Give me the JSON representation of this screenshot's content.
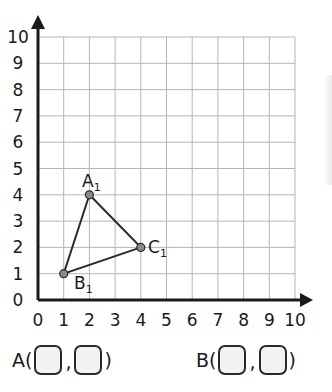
{
  "chart_data": {
    "type": "scatter",
    "title": "",
    "xlabel": "",
    "ylabel": "",
    "xlim": [
      0,
      10
    ],
    "ylim": [
      0,
      10
    ],
    "grid": true,
    "x_ticks": [
      "0",
      "1",
      "2",
      "3",
      "4",
      "5",
      "6",
      "7",
      "8",
      "9",
      "10"
    ],
    "y_ticks": [
      "0",
      "1",
      "2",
      "3",
      "4",
      "5",
      "6",
      "7",
      "8",
      "9",
      "10"
    ],
    "shape": "triangle",
    "points": [
      {
        "label": "A₁",
        "x": 2,
        "y": 4
      },
      {
        "label": "B₁",
        "x": 1,
        "y": 1
      },
      {
        "label": "C₁",
        "x": 4,
        "y": 2
      }
    ],
    "polygon_order": [
      "A₁",
      "C₁",
      "B₁"
    ]
  },
  "labels": {
    "A1_main": "A",
    "A1_sub": "1",
    "B1_main": "B",
    "B1_sub": "1",
    "C1_main": "C",
    "C1_sub": "1"
  },
  "answers": {
    "a": {
      "prefix": "A(",
      "separator": ",",
      "suffix": ")",
      "x_value": "",
      "y_value": ""
    },
    "b": {
      "prefix": "B(",
      "separator": ",",
      "suffix": ")",
      "x_value": "",
      "y_value": ""
    }
  },
  "colors": {
    "axis": "#1a1a1a",
    "grid": "#b5b5b5",
    "triangle": "#2a2a2a",
    "point_fill": "#8a8a8a",
    "box_fill": "#f2f2f2"
  }
}
